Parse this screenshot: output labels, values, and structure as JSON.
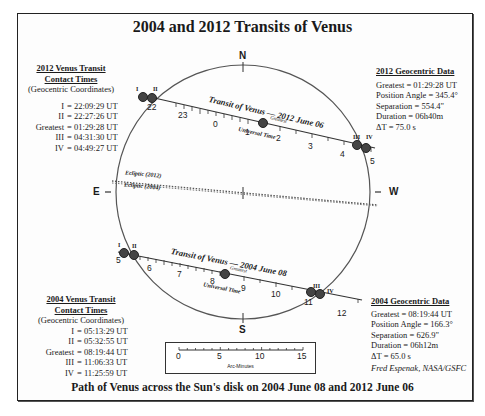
{
  "title": "2004 and 2012 Transits of Venus",
  "caption": "Path of Venus across the Sun's disk on 2004 June 08 and 2012 June 06",
  "directions": {
    "north": "N",
    "south": "S",
    "east": "E",
    "west": "W"
  },
  "contact_2012": {
    "header1": "2012 Venus Transit",
    "header2": "Contact Times",
    "subheader": "(Geocentric Coordinates)",
    "rows": [
      {
        "label": "I",
        "value": "= 22:09:29 UT"
      },
      {
        "label": "II",
        "value": "= 22:27:26 UT"
      },
      {
        "label": "Greatest",
        "value": "= 01:29:28 UT"
      },
      {
        "label": "III",
        "value": "= 04:31:30 UT"
      },
      {
        "label": "IV",
        "value": "= 04:49:27 UT"
      }
    ]
  },
  "contact_2004": {
    "header1": "2004 Venus Transit",
    "header2": "Contact Times",
    "subheader": "(Geocentric Coordinates)",
    "rows": [
      {
        "label": "I",
        "value": "= 05:13:29 UT"
      },
      {
        "label": "II",
        "value": "= 05:32:55 UT"
      },
      {
        "label": "Greatest",
        "value": "= 08:19:44 UT"
      },
      {
        "label": "III",
        "value": "= 11:06:33 UT"
      },
      {
        "label": "IV",
        "value": "= 11:25:59 UT"
      }
    ]
  },
  "geo_2012": {
    "header": "2012 Geocentric Data",
    "rows": [
      "Greatest = 01:29:28 UT",
      "Position Angle =  345.4°",
      "Separation =   554.4\"",
      "Duration = 06h40m",
      "ΔT =    75.0 s"
    ]
  },
  "geo_2004": {
    "header": "2004 Geocentric Data",
    "rows": [
      "Greatest = 08:19:44 UT",
      "Position Angle =  166.3°",
      "Separation =   626.9\"",
      "Duration = 06h12m",
      "ΔT =    65.0 s"
    ],
    "credit": "Fred Espenak, NASA/GSFC"
  },
  "transit_2012": {
    "label": "Transit of Venus — 2012 June 06",
    "time_label": "Universal Time",
    "greatest_label": "Greatest",
    "hour_ticks": [
      "22",
      "23",
      "0",
      "1",
      "2",
      "3",
      "4",
      "5"
    ],
    "contacts": [
      "I",
      "II",
      "III",
      "IV"
    ]
  },
  "transit_2004": {
    "label": "Transit of Venus — 2004 June 08",
    "time_label": "Universal Time",
    "greatest_label": "Greatest",
    "hour_ticks": [
      "5",
      "6",
      "7",
      "8",
      "9",
      "10",
      "11",
      "12"
    ],
    "contacts": [
      "I",
      "II",
      "III",
      "IV"
    ]
  },
  "ecliptic": {
    "label_2012": "Ecliptic (2012)",
    "label_2004": "Ecliptic (2004)"
  },
  "scale_bar": {
    "ticks": [
      "0",
      "5",
      "10",
      "15"
    ],
    "unit": "Arc-Minutes"
  }
}
